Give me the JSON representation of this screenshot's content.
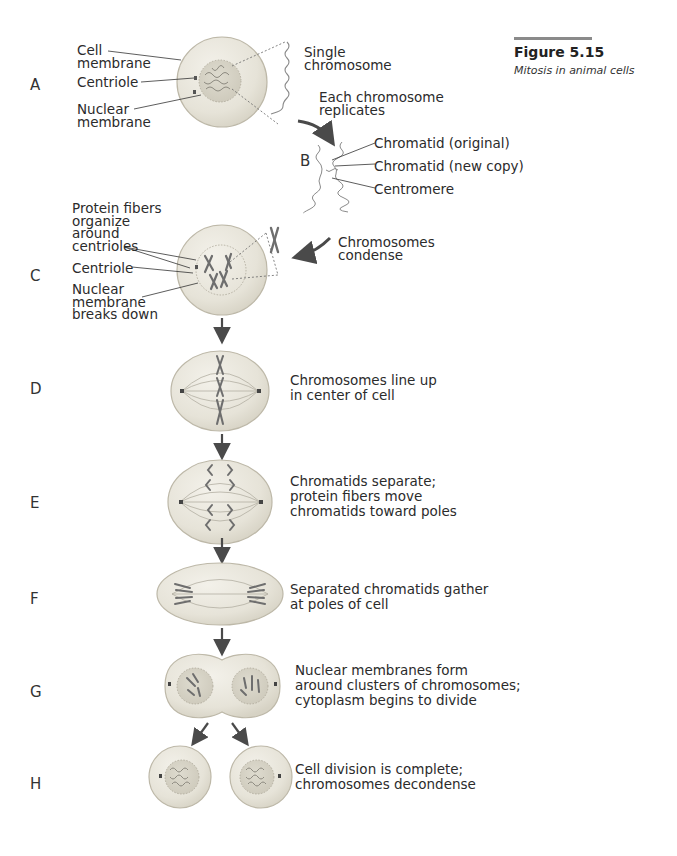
{
  "figure": {
    "number": "Figure 5.15",
    "caption": "Mitosis in animal cells"
  },
  "stages": [
    {
      "letter": "A"
    },
    {
      "letter": "B"
    },
    {
      "letter": "C"
    },
    {
      "letter": "D"
    },
    {
      "letter": "E"
    },
    {
      "letter": "F"
    },
    {
      "letter": "G"
    },
    {
      "letter": "H"
    }
  ],
  "labels": {
    "a_cell_membrane": "Cell\nmembrane",
    "a_centriole": "Centriole",
    "a_nuclear_membrane": "Nuclear\nmembrane",
    "a_single_chromosome": "Single\nchromosome",
    "replicates": "Each chromosome\nreplicates",
    "b_chromatid_original": "Chromatid (original)",
    "b_chromatid_new": "Chromatid (new copy)",
    "b_centromere": "Centromere",
    "c_protein_fibers": "Protein fibers\norganize\naround\ncentrioles",
    "c_centriole": "Centriole",
    "c_nuclear_breaks": "Nuclear\nmembrane\nbreaks down",
    "condense": "Chromosomes\ncondense"
  },
  "descriptions": {
    "D": "Chromosomes line up\nin center of cell",
    "E": "Chromatids separate;\nprotein fibers move\nchromatids toward poles",
    "F": "Separated chromatids gather\nat poles of cell",
    "G": "Nuclear membranes form\naround clusters of chromosomes;\ncytoplasm begins to divide",
    "H": "Cell division is complete;\nchromosomes decondense"
  },
  "colors": {
    "cell_fill": "#e9e6dc",
    "cell_edge": "#bdb8a8",
    "nucleus_fill": "#d8d4c6",
    "chromosome": "#6e6e6e",
    "arrow": "#4a4a4a",
    "rule": "#8a8a8a"
  }
}
